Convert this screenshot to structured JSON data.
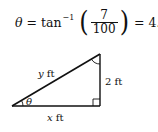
{
  "equation": {
    "lhs": "θ",
    "equals1": "=",
    "func": "tan",
    "exponent": "−1",
    "numerator": "7",
    "denominator": "100",
    "equals2": "=",
    "result": "4.004°."
  },
  "diagram": {
    "hypotenuse_label_var": "y",
    "hypotenuse_label_unit": "ft",
    "vertical_label_num": "2",
    "vertical_label_unit": "ft",
    "base_label_var": "x",
    "base_label_unit": "ft",
    "angle_label": "θ"
  }
}
